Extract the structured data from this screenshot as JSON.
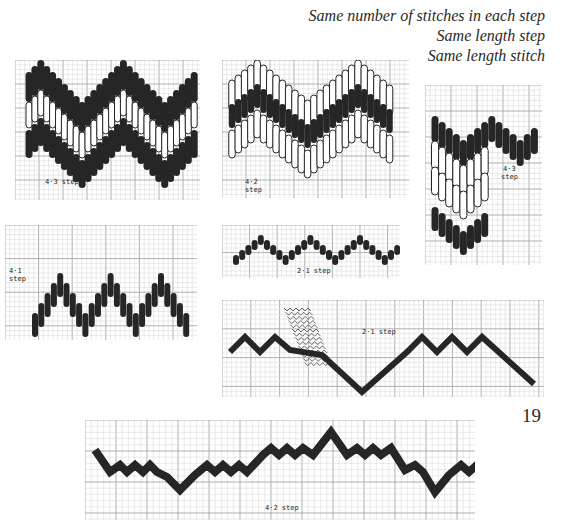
{
  "caption": {
    "lines": [
      "Same number of stitches in each step",
      "Same length step",
      "Same length stitch"
    ]
  },
  "page_number": "19",
  "colors": {
    "ink": "#262626",
    "grid_minor": "#d6d6d6",
    "grid_major": "#a8a8a8",
    "paper": "#ffffff"
  },
  "diagrams": [
    {
      "id": "bargello-4-3-overlay",
      "label": "4·3 step",
      "box": [
        15,
        60,
        185,
        140
      ]
    },
    {
      "id": "bargello-4-2-overlay",
      "label_line1": "4·2",
      "label_line2": "step",
      "box": [
        222,
        60,
        187,
        138
      ]
    },
    {
      "id": "bargello-4-3-partial",
      "label_line1": "4·3",
      "label_line2": "step",
      "box": [
        425,
        85,
        117,
        180
      ]
    },
    {
      "id": "bargello-4-1",
      "label_line1": "4·1",
      "label_line2": "step",
      "box": [
        5,
        225,
        192,
        115
      ]
    },
    {
      "id": "bargello-2-1-short",
      "label": "2·1 step",
      "box": [
        222,
        225,
        178,
        53
      ]
    },
    {
      "id": "bargello-2-1-long",
      "label": "2·1 step",
      "box": [
        222,
        300,
        322,
        97
      ]
    },
    {
      "id": "bargello-4-2-band",
      "label": "4·2 step",
      "box": [
        85,
        420,
        390,
        100
      ]
    }
  ]
}
